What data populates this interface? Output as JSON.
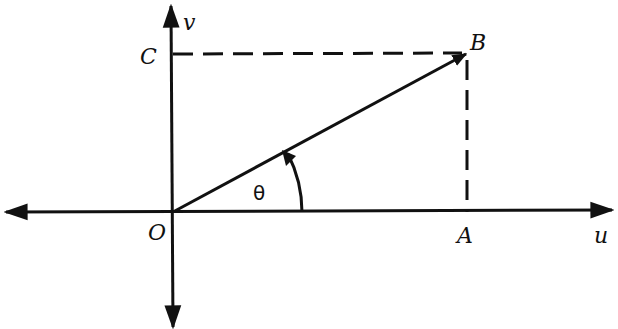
{
  "diagram": {
    "type": "vector-decomposition",
    "axes": {
      "horizontal_label": "u",
      "vertical_label": "v"
    },
    "points": {
      "origin": "O",
      "tip": "B",
      "u_projection": "A",
      "v_projection": "C"
    },
    "angle_label": "θ",
    "colors": {
      "ink": "#111111",
      "background": "#ffffff"
    }
  }
}
